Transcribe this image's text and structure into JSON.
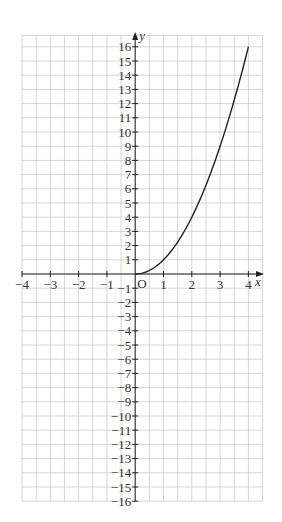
{
  "chart_data": {
    "type": "line",
    "title": "",
    "xlabel": "x",
    "ylabel": "y",
    "origin_label": "O",
    "xlim": [
      -4,
      4.5
    ],
    "ylim": [
      -16,
      16.8
    ],
    "x_ticks": [
      -4,
      -3,
      -2,
      -1,
      1,
      2,
      3,
      4
    ],
    "x_tick_labels": [
      "−4",
      "−3",
      "−2",
      "−1",
      "1",
      "2",
      "3",
      "4"
    ],
    "y_ticks": [
      16,
      15,
      14,
      13,
      12,
      11,
      10,
      9,
      8,
      7,
      6,
      5,
      4,
      3,
      2,
      1,
      -1,
      -2,
      -3,
      -4,
      -5,
      -6,
      -7,
      -8,
      -9,
      -10,
      -11,
      -12,
      -13,
      -14,
      -15,
      -16
    ],
    "y_tick_labels": [
      "16",
      "15",
      "14",
      "13",
      "12",
      "11",
      "10",
      "9",
      "8",
      "7",
      "6",
      "5",
      "4",
      "3",
      "2",
      "1",
      "−1",
      "−2",
      "−3",
      "−4",
      "−5",
      "−6",
      "−7",
      "−8",
      "−9",
      "−10",
      "−11",
      "−12",
      "−13",
      "−14",
      "−15",
      "−16"
    ],
    "grid": true,
    "grid_x_step": 0.5,
    "grid_y_step": 1,
    "legend": null,
    "series": [
      {
        "name": "y = x²",
        "x": [
          0,
          0.5,
          1,
          1.5,
          2,
          2.5,
          3,
          3.5,
          4
        ],
        "values": [
          0,
          0.25,
          1,
          2.25,
          4,
          6.25,
          9,
          12.25,
          16
        ]
      }
    ],
    "colors": {
      "grid": "#cccccc",
      "axis": "#222222",
      "curve": "#222222",
      "labels": "#333333"
    }
  }
}
